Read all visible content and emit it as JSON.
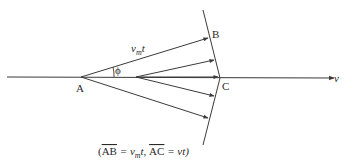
{
  "diagram": {
    "type": "wavefront-geometry",
    "points": {
      "A": "A",
      "B": "B",
      "C": "C"
    },
    "labels": {
      "segment_AB_top": "v",
      "segment_AB_sub": "m",
      "segment_AB_t": "t",
      "angle": "ϕ",
      "velocity": "v"
    },
    "caption": {
      "open": "(",
      "ab": "AB",
      "eq1": " = v",
      "sub": "m",
      "t1": "t, ",
      "ac": "AC",
      "eq2": " = vt)"
    },
    "colors": {
      "line": "#3a3a3a",
      "text": "#2a2a2a",
      "background": "#ffffff"
    }
  }
}
